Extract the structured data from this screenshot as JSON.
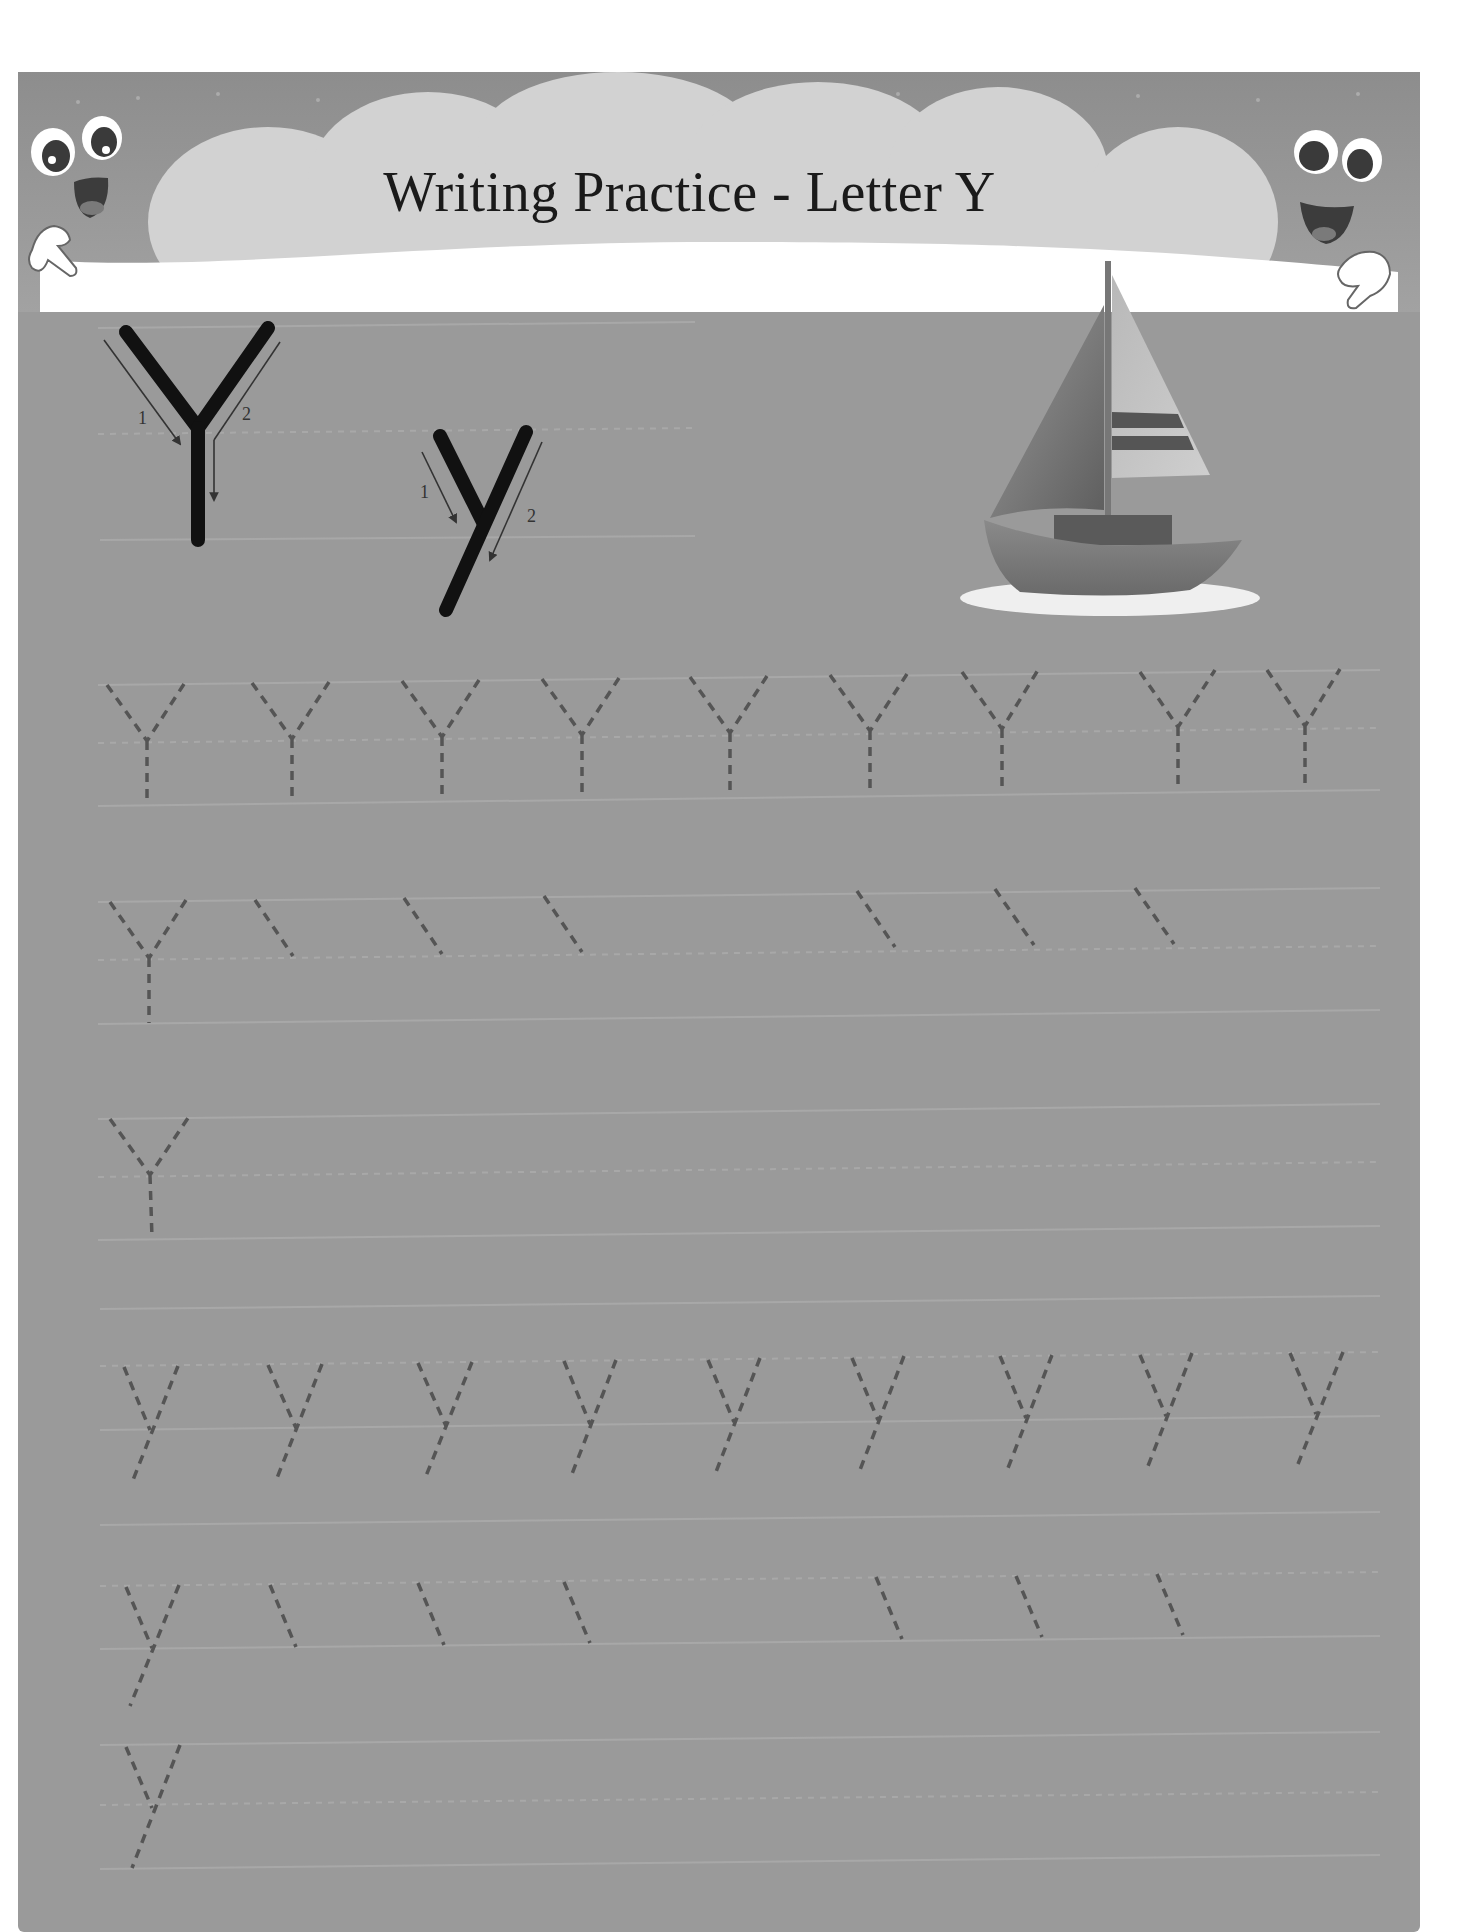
{
  "worksheet": {
    "title": "Writing Practice - Letter Y",
    "letter_upper": "Y",
    "letter_lower": "y",
    "picture": "sailboat",
    "model_letters": [
      {
        "glyph": "Y",
        "case": "uppercase",
        "stroke_labels": [
          "1",
          "2"
        ]
      },
      {
        "glyph": "y",
        "case": "lowercase",
        "stroke_labels": [
          "1",
          "2"
        ]
      }
    ],
    "practice_rows": [
      {
        "row": 1,
        "case": "uppercase",
        "traceable_letters": 7,
        "style": "full dashed Y"
      },
      {
        "row": 2,
        "case": "uppercase",
        "traceable_letters": 7,
        "style": "first full Y, then first stroke only"
      },
      {
        "row": 3,
        "case": "uppercase",
        "traceable_letters": 1,
        "style": "single dashed Y, blank remainder"
      },
      {
        "row": 4,
        "case": "lowercase",
        "traceable_letters": 7,
        "style": "full dashed y"
      },
      {
        "row": 5,
        "case": "lowercase",
        "traceable_letters": 7,
        "style": "first full y, then first stroke only"
      },
      {
        "row": 6,
        "case": "lowercase",
        "traceable_letters": 1,
        "style": "single dashed y, blank remainder"
      }
    ]
  },
  "icons": {
    "left_mascot": "smiley-pointing-hand-icon",
    "right_mascot": "smiley-pointing-hand-icon",
    "boat": "sailboat-icon"
  },
  "colors": {
    "frame": "#9a9a9a",
    "cloud": "#cfcfcf",
    "guide_line": "#a8a8a8",
    "trace_dash": "#555555",
    "model_stroke": "#111111"
  }
}
